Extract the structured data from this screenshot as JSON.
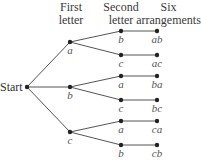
{
  "headers": {
    "first": [
      "First",
      "letter"
    ],
    "second": [
      "Second",
      "letter"
    ],
    "six": [
      "Six",
      "arrangements"
    ]
  },
  "root": {
    "label": "Start",
    "x": 27,
    "y": 87
  },
  "first_level": [
    {
      "label": "a",
      "x": 70,
      "y": 42
    },
    {
      "label": "b",
      "x": 70,
      "y": 87
    },
    {
      "label": "c",
      "x": 70,
      "y": 132
    }
  ],
  "second_level": [
    {
      "parent": 0,
      "label": "b",
      "x": 121,
      "y": 31
    },
    {
      "parent": 0,
      "label": "c",
      "x": 121,
      "y": 55
    },
    {
      "parent": 1,
      "label": "a",
      "x": 121,
      "y": 76
    },
    {
      "parent": 1,
      "label": "c",
      "x": 121,
      "y": 100
    },
    {
      "parent": 2,
      "label": "a",
      "x": 121,
      "y": 121
    },
    {
      "parent": 2,
      "label": "b",
      "x": 121,
      "y": 145
    }
  ],
  "arrangements": [
    {
      "label": "ab",
      "x": 157,
      "y": 31
    },
    {
      "label": "ac",
      "x": 157,
      "y": 55
    },
    {
      "label": "ba",
      "x": 157,
      "y": 76
    },
    {
      "label": "bc",
      "x": 157,
      "y": 100
    },
    {
      "label": "ca",
      "x": 157,
      "y": 121
    },
    {
      "label": "cb",
      "x": 157,
      "y": 145
    }
  ],
  "colors": {
    "line": "#555555",
    "node": "#222222"
  }
}
